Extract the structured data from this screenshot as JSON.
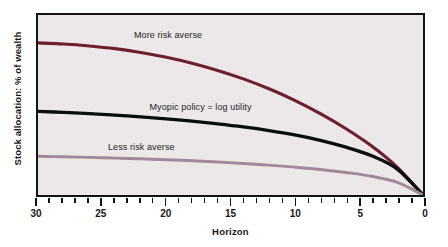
{
  "chart_data": {
    "type": "line",
    "title": "",
    "xlabel": "Horizon",
    "ylabel": "Stock allocation: % of wealth",
    "xlim": [
      30,
      0
    ],
    "ylim": [
      0,
      100
    ],
    "x_axis_reversed": true,
    "grid": false,
    "legend_position": "inline-annotations",
    "background_color": "#ece7e8",
    "frame_color": "#141414",
    "x_ticks_major": [
      30,
      25,
      20,
      15,
      10,
      5,
      0
    ],
    "x_tick_labels": [
      "30",
      "25",
      "20",
      "15",
      "10",
      "5",
      "0"
    ],
    "x_ticks_minor_step": 1,
    "y_ticks": [],
    "y_tick_labels": [],
    "x": [
      30,
      28,
      26,
      24,
      22,
      20,
      18,
      16,
      14,
      12,
      10,
      8,
      6,
      4,
      2,
      0
    ],
    "series": [
      {
        "name": "More risk averse",
        "color": "#6e1f2b",
        "label_x": 22.6,
        "label_y": 88,
        "values": [
          84.5,
          83.9,
          82.8,
          81.3,
          79.2,
          76.5,
          73.2,
          69.2,
          64.5,
          59.0,
          52.6,
          45.2,
          36.8,
          27.2,
          15.4,
          0
        ]
      },
      {
        "name": "Myopic policy = log utility",
        "color": "#0d0d0d",
        "label_x": 21.4,
        "label_y": 49,
        "values": [
          46.5,
          45.9,
          45.2,
          44.4,
          43.4,
          42.3,
          41.0,
          39.5,
          37.8,
          35.8,
          33.4,
          30.4,
          26.6,
          21.8,
          14.4,
          0
        ]
      },
      {
        "name": "Less risk averse",
        "color": "#a2899a",
        "label_x": 24.6,
        "label_y": 27,
        "values": [
          21.5,
          21.2,
          20.9,
          20.5,
          20.1,
          19.6,
          19.0,
          18.3,
          17.5,
          16.6,
          15.5,
          14.2,
          12.5,
          10.4,
          7.0,
          0
        ]
      }
    ]
  },
  "labels": {
    "y_axis_title": "Stock allocation: % of wealth",
    "x_axis_title": "Horizon",
    "series_more": "More risk averse",
    "series_myopic": "Myopic policy = log utility",
    "series_less": "Less risk averse"
  },
  "tick_labels": {
    "t0": "30",
    "t1": "25",
    "t2": "20",
    "t3": "15",
    "t4": "10",
    "t5": "5",
    "t6": "0"
  }
}
